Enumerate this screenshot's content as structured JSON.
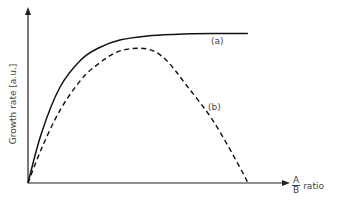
{
  "chart_data": {
    "type": "line",
    "title": "",
    "xlabel": "A/B ratio",
    "xlabel_parts": {
      "numerator": "A",
      "denominator": "B",
      "suffix": "ratio"
    },
    "ylabel": "Growth rate [a.u.]",
    "grid": false,
    "legend": "none (inline annotations)",
    "x_ticks": [],
    "y_ticks": [],
    "xlim": [
      0,
      1
    ],
    "ylim": [
      0,
      1
    ],
    "series": [
      {
        "name": "(a)",
        "style": "solid",
        "color": "#111111",
        "x": [
          0.0,
          0.05,
          0.12,
          0.2,
          0.27,
          0.35,
          0.45,
          0.55,
          0.7,
          0.83
        ],
        "y": [
          0.0,
          0.32,
          0.62,
          0.8,
          0.88,
          0.93,
          0.955,
          0.965,
          0.97,
          0.97
        ]
      },
      {
        "name": "(b)",
        "style": "dashed",
        "color": "#111111",
        "x": [
          0.0,
          0.05,
          0.12,
          0.2,
          0.27,
          0.35,
          0.45,
          0.52,
          0.6,
          0.7,
          0.8,
          0.83
        ],
        "y": [
          0.0,
          0.22,
          0.47,
          0.67,
          0.78,
          0.86,
          0.87,
          0.8,
          0.63,
          0.4,
          0.1,
          0.0
        ]
      }
    ],
    "annotations": [
      {
        "text": "(a)",
        "near_series": "(a)"
      },
      {
        "text": "(b)",
        "near_series": "(b)"
      }
    ]
  },
  "labels": {
    "ylabel": "Growth rate [a.u.]",
    "x_num": "A",
    "x_den": "B",
    "x_suffix": "ratio",
    "annot_a": "(a)",
    "annot_b": "(b)"
  }
}
